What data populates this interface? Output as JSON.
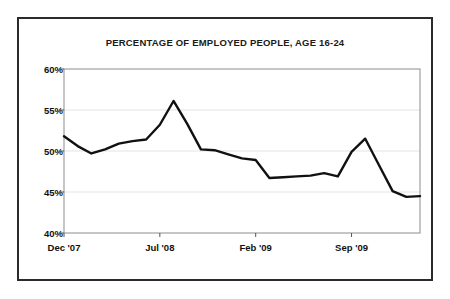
{
  "chart_data": {
    "type": "line",
    "title": "PERCENTAGE OF EMPLOYED PEOPLE, AGE 16-24",
    "xlabel": "",
    "ylabel": "",
    "ylim": [
      40,
      60
    ],
    "ytick_values": [
      40,
      45,
      50,
      55,
      60
    ],
    "ytick_labels": [
      "40%",
      "45%",
      "50%",
      "55%",
      "60%"
    ],
    "grid": true,
    "grid_axis": "y",
    "legend": false,
    "x": [
      "Dec '07",
      "Jan '08",
      "Feb '08",
      "Mar '08",
      "Apr '08",
      "May '08",
      "Jun '08",
      "Jul '08",
      "Aug '08",
      "Sep '08",
      "Oct '08",
      "Nov '08",
      "Dec '08",
      "Jan '09",
      "Feb '09",
      "Mar '09",
      "Apr '09",
      "May '09",
      "Jun '09",
      "Jul '09",
      "Aug '09",
      "Sep '09",
      "Oct '09",
      "Nov '09",
      "Dec '09"
    ],
    "xtick_labels": [
      "Dec '07",
      "Jul '08",
      "Feb '09",
      "Sep '09"
    ],
    "xtick_indices": [
      0,
      7,
      14,
      21
    ],
    "values": [
      51.8,
      50.6,
      49.7,
      50.2,
      50.9,
      51.2,
      51.4,
      53.2,
      56.1,
      53.3,
      50.2,
      50.1,
      49.6,
      49.1,
      48.9,
      46.7,
      46.8,
      46.9,
      47.0,
      47.3,
      46.9,
      49.9,
      51.5,
      48.3,
      45.1
    ],
    "values_tail": [
      44.4,
      44.5
    ],
    "series_color": "#111111",
    "line_width": 2.4,
    "grid_color": "#e3e3e3",
    "axis_color": "#8c8c8c",
    "frame_color": "#2b2b2b",
    "background": "#ffffff"
  }
}
